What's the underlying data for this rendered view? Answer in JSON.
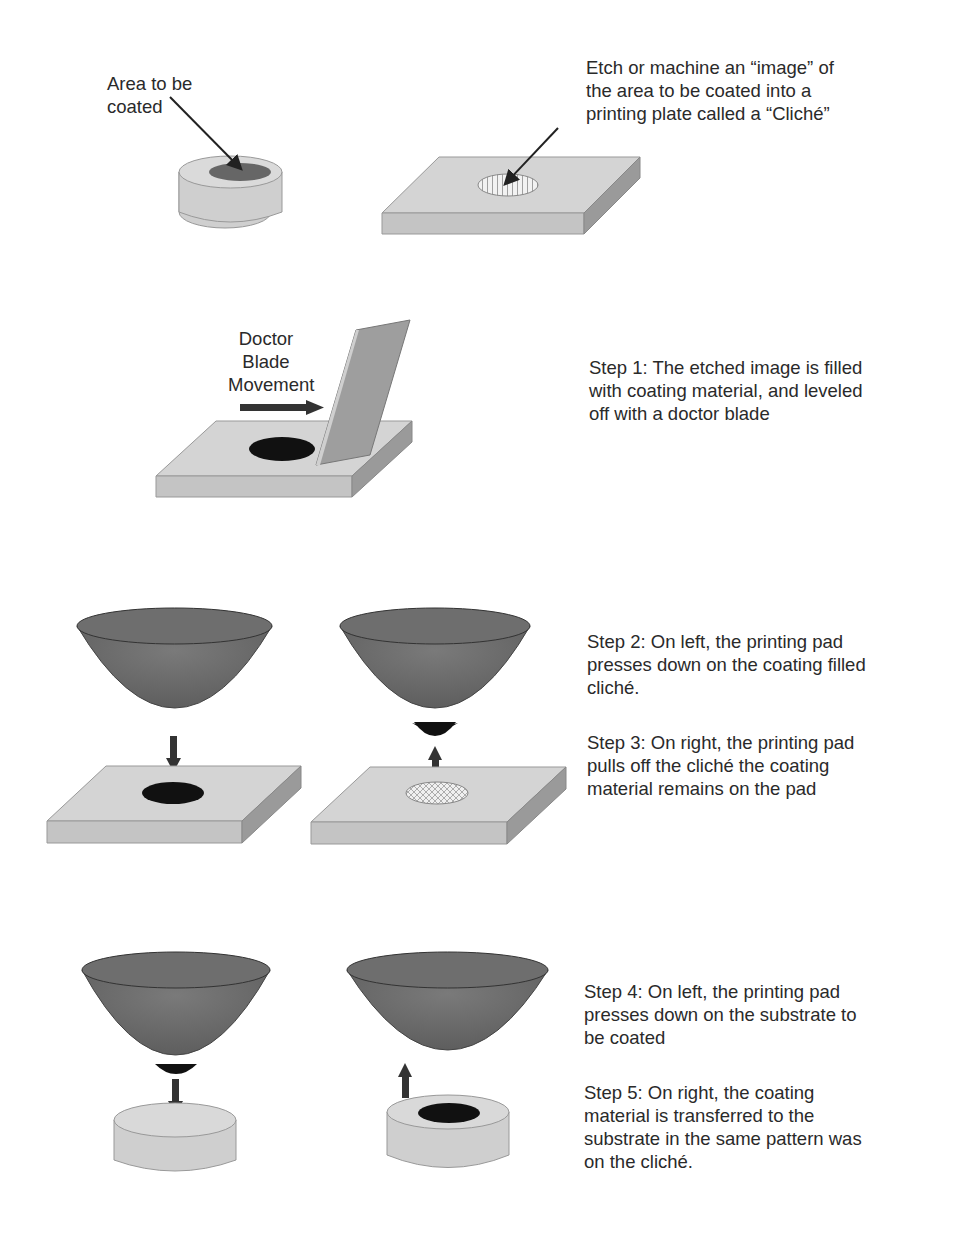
{
  "labels": {
    "area_to_be_coated": "Area to be\ncoated",
    "etch_caption": "Etch or machine an “image” of\nthe area to be coated into a\nprinting plate called a “Cliché”",
    "doctor_blade": "Doctor\nBlade\nMovement"
  },
  "steps": [
    {
      "id": "step1",
      "text": "Step 1: The etched image is filled\nwith coating material, and leveled\noff with a doctor blade"
    },
    {
      "id": "step2",
      "text": "Step 2: On left, the printing pad\npresses down on the coating filled\ncliché."
    },
    {
      "id": "step3",
      "text": "Step 3: On right, the printing pad\npulls off the cliché the coating\nmaterial remains on the pad"
    },
    {
      "id": "step4",
      "text": "Step 4: On left, the printing pad\npresses down on the substrate to\nbe coated"
    },
    {
      "id": "step5",
      "text": "Step 5: On right, the coating\nmaterial is transferred to the\nsubstrate in the same pattern was\non the cliché."
    }
  ],
  "colors": {
    "plate_top": "#d4d4d4",
    "plate_side": "#bdbdbd",
    "plate_dark_side": "#8e8e8e",
    "pad": "#6a6a6a",
    "coating": "#111111",
    "arrow": "#333333"
  }
}
